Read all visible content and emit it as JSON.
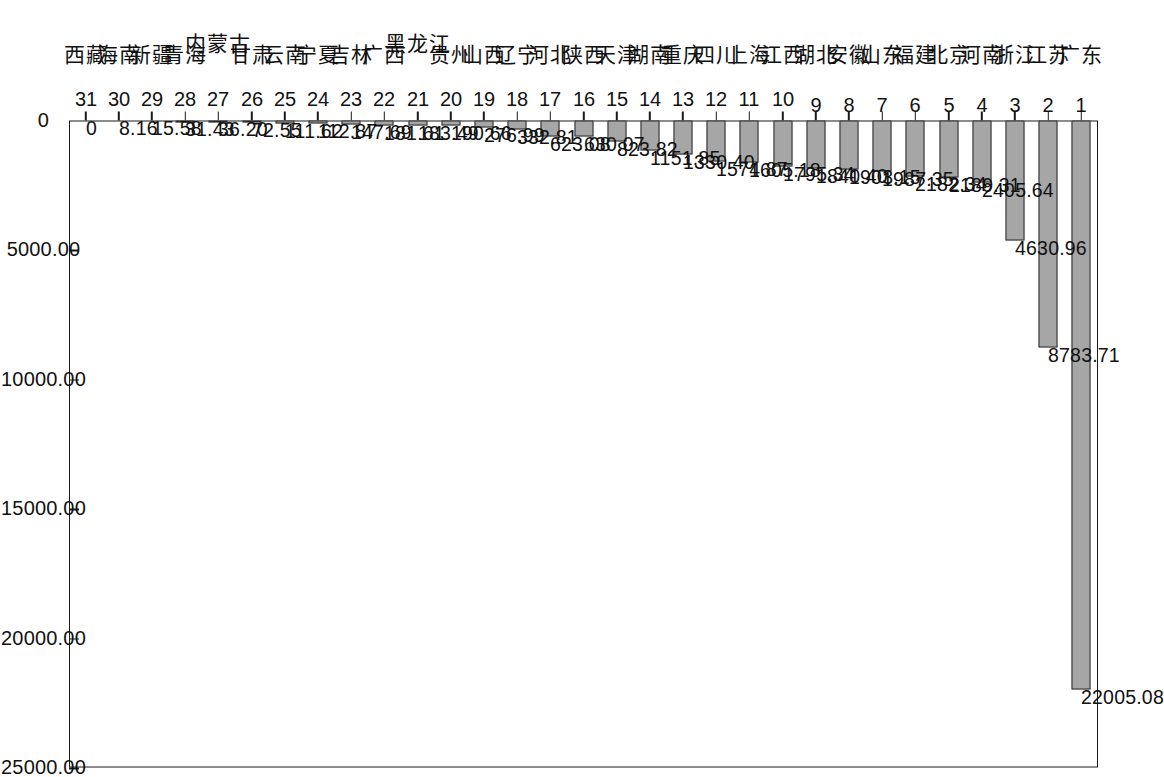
{
  "chart_data": {
    "type": "bar",
    "orientation": "vertical-bars-rotated-90",
    "title": "",
    "subtitle": "",
    "xlabel": "",
    "ylabel": "",
    "grid": false,
    "legend": null,
    "value_axis": {
      "min": 0,
      "max": 25000,
      "tick_values": [
        0,
        5000,
        10000,
        15000,
        20000,
        25000
      ],
      "tick_labels": [
        "0",
        "5000.00",
        "10000.00",
        "15000.00",
        "20000.00",
        "25000.00"
      ],
      "last_tick_clipped": true
    },
    "categories": [
      "广东",
      "江苏",
      "浙江",
      "河南",
      "北京",
      "福建",
      "山东",
      "安徽",
      "湖北",
      "江西",
      "上海",
      "四川",
      "重庆",
      "湖南",
      "天津",
      "陕西",
      "河北",
      "辽宁",
      "山西",
      "贵州",
      "黑龙江",
      "广西",
      "吉林",
      "宁夏",
      "云南",
      "甘肃",
      "内蒙古",
      "青海",
      "新疆",
      "海南",
      "西藏"
    ],
    "indices": [
      "1",
      "2",
      "3",
      "4",
      "5",
      "6",
      "7",
      "8",
      "9",
      "10",
      "11",
      "12",
      "13",
      "14",
      "15",
      "16",
      "17",
      "18",
      "19",
      "20",
      "21",
      "22",
      "23",
      "24",
      "25",
      "26",
      "27",
      "28",
      "29",
      "30",
      "31"
    ],
    "values": [
      22005.08,
      8783.71,
      4630.96,
      2405.64,
      2189.31,
      2182.34,
      1987.35,
      1903.15,
      1840.4,
      1795.34,
      1605.18,
      1574.87,
      1330.4,
      1151.85,
      823.82,
      630.07,
      623.08,
      332.81,
      276.99,
      190.66,
      183.49,
      181.61,
      147.69,
      112.87,
      111.62,
      72.55,
      36.2,
      31.43,
      15.58,
      8.16,
      0
    ],
    "value_labels": [
      "22005.08",
      "8783.71",
      "4630.96",
      "2405.64",
      "2189.31",
      "2182.34",
      "1987.35",
      "1903.15",
      "1840.40",
      "1795.34",
      "1605.18",
      "1574.87",
      "1330.40",
      "1151.85",
      "823.82",
      "630.07",
      "623.08",
      "332.81",
      "276.99",
      "190.66",
      "183.49",
      "181.61",
      "147.69",
      "112.87",
      "111.62",
      "72.55",
      "36.20",
      "31.43",
      "15.58",
      "8.16",
      "0"
    ]
  },
  "style": {
    "bar_fill": "#a6a6a6",
    "bar_border": "#2b2b2b",
    "axis_color": "#1a1a1a",
    "text_color": "#111111",
    "background": "#ffffff"
  }
}
